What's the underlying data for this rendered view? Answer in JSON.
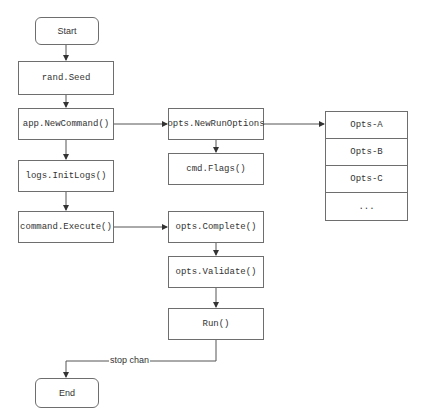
{
  "nodes": {
    "start": "Start",
    "rand_seed": "rand.Seed",
    "new_command": "app.NewCommand()",
    "init_logs": "logs.InitLogs()",
    "execute": "command.Execute()",
    "new_run_options": "opts.NewRunOptions",
    "flags": "cmd.Flags()",
    "complete": "opts.Complete()",
    "validate": "opts.Validate()",
    "run": "Run()",
    "end": "End"
  },
  "opts_table": [
    "Opts-A",
    "Opts-B",
    "Opts-C",
    "..."
  ],
  "edge_labels": {
    "stop_chan": "stop chan"
  },
  "colors": {
    "stroke": "#6e6e6e",
    "text": "#333333",
    "background": "#ffffff"
  }
}
